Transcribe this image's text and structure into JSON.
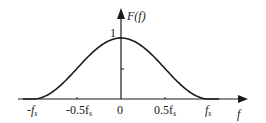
{
  "chart_data": {
    "type": "line",
    "title": "",
    "xlabel": "f",
    "ylabel": "F(f)",
    "function": "raised cosine: F(f) = 0.5*(1+cos(pi*f/fs)) for |f|<=fs",
    "x_ticks": [
      {
        "value": -1.0,
        "label": "-f",
        "sub": "s"
      },
      {
        "value": -0.5,
        "label": "-0.5f",
        "sub": "s"
      },
      {
        "value": 0,
        "label": "0",
        "sub": ""
      },
      {
        "value": 0.5,
        "label": "0.5f",
        "sub": "s"
      },
      {
        "value": 1.0,
        "label": "f",
        "sub": "s"
      }
    ],
    "y_ticks": [
      {
        "value": 0.5,
        "label": ""
      },
      {
        "value": 1,
        "label": "1"
      }
    ],
    "x_unit": "fs",
    "x": [
      -1.0,
      -0.75,
      -0.5,
      -0.25,
      0,
      0.25,
      0.5,
      0.75,
      1.0
    ],
    "values": [
      0,
      0.146,
      0.5,
      0.854,
      1.0,
      0.854,
      0.5,
      0.146,
      0
    ],
    "xlim": [
      -1.2,
      1.45
    ],
    "ylim": [
      0,
      1.35
    ],
    "grid": false,
    "legend": "none",
    "color": "#1a1a1a"
  },
  "labels": {
    "y_axis": "F(f)",
    "x_axis": "f",
    "peak": "1",
    "origin": "0",
    "neg_fs_main": "-f",
    "neg_half_main": "-0.5f",
    "pos_half_main": "0.5f",
    "pos_fs_main": "f",
    "sub": "s"
  }
}
